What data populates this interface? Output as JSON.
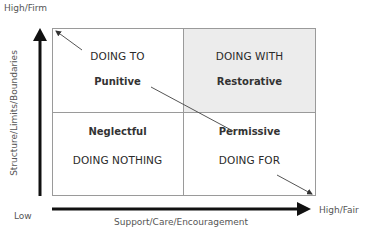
{
  "axes": {
    "y_high_label": "High/Firm",
    "y_title": "Structure/Limits/Boundaries",
    "x_low_label": "Low",
    "x_title": "Support/Care/Encouragement",
    "x_high_label": "High/Fair"
  },
  "quadrants": {
    "top_left": {
      "mode": "DOING TO",
      "style": "Punitive"
    },
    "top_right": {
      "mode": "DOING WITH",
      "style": "Restorative"
    },
    "bottom_left": {
      "style": "Neglectful",
      "mode": "DOING NOTHING"
    },
    "bottom_right": {
      "style": "Permissive",
      "mode": "DOING FOR"
    }
  },
  "colors": {
    "highlight_fill": "#ececec",
    "line": "#888888",
    "arrow": "#111111"
  }
}
